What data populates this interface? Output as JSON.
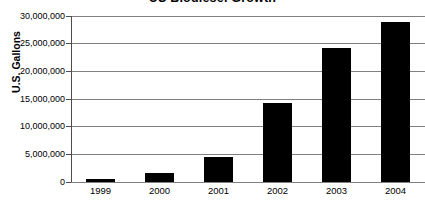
{
  "chart_data": {
    "type": "bar",
    "title": "US Biodiesel Growth",
    "xlabel": "",
    "ylabel": "U.S. Gallons",
    "categories": [
      "1999",
      "2000",
      "2001",
      "2002",
      "2003",
      "2004"
    ],
    "values": [
      500000,
      1700000,
      4600000,
      14200000,
      24300000,
      29000000
    ],
    "ylim": [
      0,
      30000000
    ],
    "ytick_values": [
      0,
      5000000,
      10000000,
      15000000,
      20000000,
      25000000,
      30000000
    ],
    "ytick_labels": [
      "0",
      "5,000,000",
      "10,000,000",
      "15,000,000",
      "20,000,000",
      "25,000,000",
      "30,000,000"
    ],
    "grid": true,
    "legend": false,
    "legend_position": "none",
    "bar_color": "#000000",
    "gridline_color": "#808080",
    "axis_color": "#4d4d4d",
    "background_color": "#ffffff"
  }
}
